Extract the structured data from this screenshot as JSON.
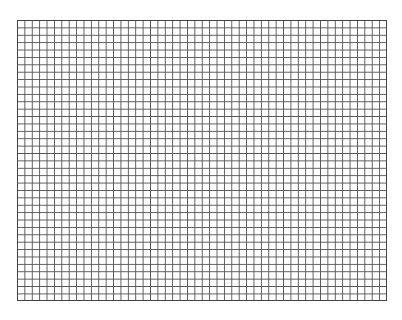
{
  "caption": {
    "text": "",
    "note": "clipped text line at top edge, unreadable"
  },
  "grid": {
    "columns": 50,
    "rows": 38,
    "line_color": "#555555",
    "background": "#ffffff"
  }
}
